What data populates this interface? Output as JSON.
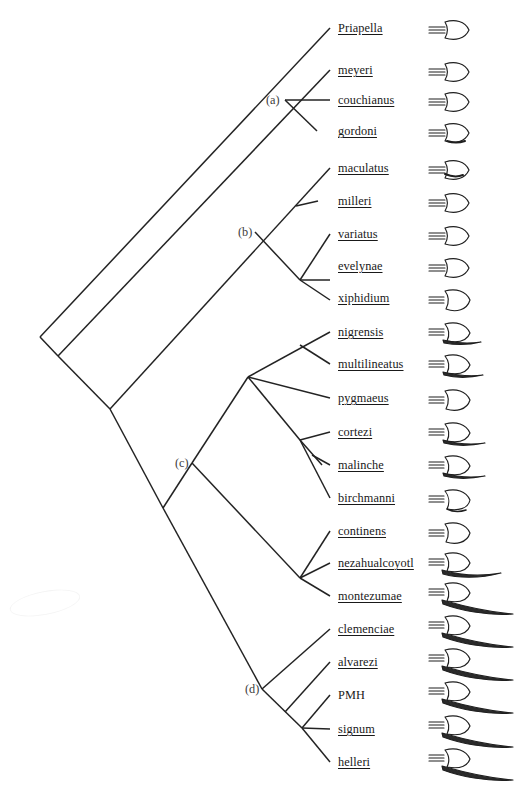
{
  "figure": {
    "type": "phylogenetic-cladogram",
    "line_color": "#232323",
    "text_color": "#191919",
    "background": "#ffffff"
  },
  "internal_nodes": [
    {
      "id": "a",
      "label": "(a)",
      "x": 285,
      "y": 100
    },
    {
      "id": "b",
      "label": "(b)",
      "x": 255,
      "y": 232
    },
    {
      "id": "c",
      "label": "(c)",
      "x": 192,
      "y": 463
    },
    {
      "id": "d",
      "label": "(d)",
      "x": 262,
      "y": 689
    }
  ],
  "tips": [
    {
      "name": "Priapella",
      "y": 28,
      "underlined": true,
      "sword": "none",
      "italic": false
    },
    {
      "name": "meyeri",
      "y": 70,
      "underlined": true,
      "sword": "none"
    },
    {
      "name": "couchianus",
      "y": 100,
      "underlined": true,
      "sword": "none"
    },
    {
      "name": "gordoni",
      "y": 131,
      "underlined": true,
      "sword": "none"
    },
    {
      "name": "maculatus",
      "y": 168,
      "underlined": true,
      "sword": "none"
    },
    {
      "name": "milleri",
      "y": 201,
      "underlined": true,
      "sword": "none"
    },
    {
      "name": "variatus",
      "y": 234,
      "underlined": true,
      "sword": "none"
    },
    {
      "name": "evelynae",
      "y": 266,
      "underlined": true,
      "sword": "none"
    },
    {
      "name": "xiphidium",
      "y": 298,
      "underlined": true,
      "sword": "none"
    },
    {
      "name": "nigrensis",
      "y": 332,
      "underlined": true,
      "sword": "short"
    },
    {
      "name": "multilineatus",
      "y": 364,
      "underlined": true,
      "sword": "short"
    },
    {
      "name": "pygmaeus",
      "y": 398,
      "underlined": true,
      "sword": "none"
    },
    {
      "name": "cortezi",
      "y": 432,
      "underlined": true,
      "sword": "short"
    },
    {
      "name": "malinche",
      "y": 465,
      "underlined": true,
      "sword": "short"
    },
    {
      "name": "birchmanni",
      "y": 498,
      "underlined": true,
      "sword": "none"
    },
    {
      "name": "continens",
      "y": 531,
      "underlined": true,
      "sword": "none"
    },
    {
      "name": "nezahualcoyotl",
      "y": 563,
      "underlined": true,
      "sword": "medium"
    },
    {
      "name": "montezumae",
      "y": 596,
      "underlined": true,
      "sword": "long"
    },
    {
      "name": "clemenciae",
      "y": 629,
      "underlined": true,
      "sword": "long"
    },
    {
      "name": "alvarezi",
      "y": 662,
      "underlined": true,
      "sword": "long"
    },
    {
      "name": "PMH",
      "y": 695,
      "underlined": false,
      "sword": "long"
    },
    {
      "name": "signum",
      "y": 729,
      "underlined": true,
      "sword": "long"
    },
    {
      "name": "helleri",
      "y": 762,
      "underlined": true,
      "sword": "long"
    }
  ],
  "label_x": 338,
  "icon_x": 425,
  "clades": {
    "a": [
      "meyeri",
      "couchianus",
      "gordoni"
    ],
    "b": [
      "maculatus",
      "milleri",
      "variatus",
      "evelynae",
      "xiphidium"
    ],
    "c": [
      "nigrensis",
      "multilineatus",
      "pygmaeus",
      "cortezi",
      "malinche",
      "birchmanni",
      "continens",
      "nezahualcoyotl",
      "montezumae"
    ],
    "d": [
      "clemenciae",
      "alvarezi",
      "PMH",
      "signum",
      "helleri"
    ]
  }
}
